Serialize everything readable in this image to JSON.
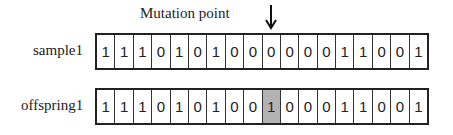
{
  "annotation": {
    "mutation_label": "Mutation point",
    "mutation_index": 9
  },
  "rows": [
    {
      "label": "sample1",
      "bits": [
        "1",
        "1",
        "1",
        "0",
        "1",
        "0",
        "1",
        "0",
        "0",
        "0",
        "0",
        "0",
        "0",
        "1",
        "1",
        "0",
        "0",
        "1"
      ]
    },
    {
      "label": "offspring1",
      "bits": [
        "1",
        "1",
        "1",
        "0",
        "1",
        "0",
        "1",
        "0",
        "0",
        "1",
        "0",
        "0",
        "0",
        "1",
        "1",
        "0",
        "0",
        "1"
      ]
    }
  ],
  "colors": {
    "highlight": "#b3b3b3",
    "border": "#222222"
  }
}
